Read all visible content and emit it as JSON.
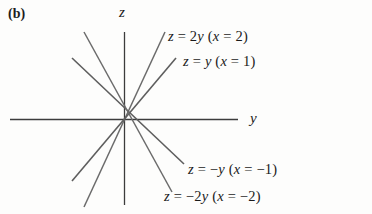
{
  "figure": {
    "panel_label": "(b)",
    "axes": {
      "vertical_label": "z",
      "horizontal_label": "y"
    },
    "equations": [
      {
        "id": "z-2y",
        "text": "z = 2y   (x = 2)",
        "lhs": "z",
        "rel": "=",
        "rhs": "2y",
        "condition": "(x = 2)"
      },
      {
        "id": "z-y",
        "text": "z = y   (x = 1)",
        "lhs": "z",
        "rel": "=",
        "rhs": "y",
        "condition": "(x = 1)"
      },
      {
        "id": "z-neg-y",
        "text": "z = −y   (x = −1)",
        "lhs": "z",
        "rel": "=",
        "rhs": "−y",
        "condition": "(x = −1)"
      },
      {
        "id": "z-neg-2y",
        "text": "z = −2y   (x = −2)",
        "lhs": "z",
        "rel": "=",
        "rhs": "−2y",
        "condition": "(x = −2)"
      }
    ],
    "colors": {
      "background": "#fdfdfc",
      "line": "#5a5a5a",
      "axis": "#3c3c3c",
      "text": "#1a1a1a"
    }
  },
  "chart_data": {
    "type": "line",
    "title": "(b)",
    "xlabel": "y",
    "ylabel": "z",
    "grid": false,
    "legend": "none",
    "xlim": [
      -4,
      4
    ],
    "ylim": [
      -3,
      3
    ],
    "series": [
      {
        "name": "z = 2y   (x = 2)",
        "slope": 2,
        "x": [
          -1.5,
          0,
          1.5
        ],
        "y": [
          -3,
          0,
          3
        ]
      },
      {
        "name": "z = y   (x = 1)",
        "slope": 1,
        "x": [
          -2.6,
          0,
          2.6
        ],
        "y": [
          -2.6,
          0,
          2.6
        ]
      },
      {
        "name": "z = −y   (x = −1)",
        "slope": -1,
        "x": [
          -2.6,
          0,
          2.6
        ],
        "y": [
          2.6,
          0,
          -2.6
        ]
      },
      {
        "name": "z = −2y   (x = −2)",
        "slope": -2,
        "x": [
          -1.5,
          0,
          1.5
        ],
        "y": [
          3,
          0,
          -3
        ]
      }
    ],
    "annotations": [
      {
        "text": "z = 2y   (x = 2)",
        "x": 1.6,
        "y": 2.9
      },
      {
        "text": "z = y   (x = 1)",
        "x": 2.0,
        "y": 2.1
      },
      {
        "text": "z = −y   (x = −1)",
        "x": 2.0,
        "y": -1.6
      },
      {
        "text": "z = −2y   (x = −2)",
        "x": 1.6,
        "y": -2.5
      },
      {
        "text": "z",
        "x": 0.0,
        "y": 3.3
      },
      {
        "text": "y",
        "x": 4.2,
        "y": 0.0
      }
    ]
  }
}
